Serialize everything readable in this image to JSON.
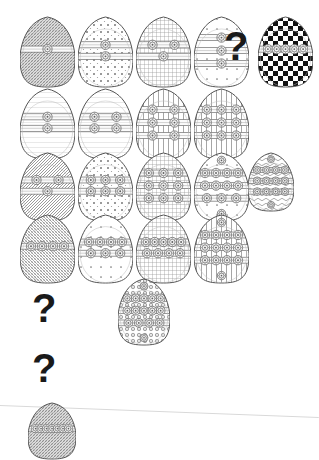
{
  "image": {
    "title": "Decorated egg pattern grid",
    "width": 319,
    "height": 460,
    "background_color": "#ffffff",
    "ink_color": "#555555",
    "question_mark_color": "#1a1a1a",
    "question_mark_glyph": "?"
  },
  "scan_artifact": {
    "name": "faint-scan-line",
    "color": "#d9d9d9",
    "x1": 0,
    "y1": 405,
    "x2": 319,
    "y2": 417
  },
  "rows": [
    {
      "row_index": 1,
      "y": 16,
      "cells": [
        {
          "kind": "egg",
          "x": 20,
          "w": 55,
          "h": 72,
          "fill": "hatch-dense",
          "bands": 1,
          "medallions": 1,
          "label": "egg-r1c1"
        },
        {
          "kind": "egg",
          "x": 78,
          "w": 55,
          "h": 72,
          "fill": "dots",
          "bands": 2,
          "medallions": 2,
          "label": "egg-r1c2"
        },
        {
          "kind": "egg",
          "x": 136,
          "w": 55,
          "h": 72,
          "fill": "grid",
          "bands": 2,
          "medallions": 3,
          "label": "egg-r1c3"
        },
        {
          "kind": "egg",
          "x": 194,
          "w": 55,
          "h": 72,
          "fill": "dots-sparse",
          "bands": 3,
          "medallions": 3,
          "label": "egg-r1c4"
        },
        {
          "kind": "question",
          "x": 224,
          "y": 26,
          "size": 40,
          "label": "question-mark-row1"
        },
        {
          "kind": "egg",
          "x": 258,
          "w": 55,
          "h": 72,
          "fill": "checker",
          "bands": 1,
          "medallions": 5,
          "label": "egg-r1-answer-checker"
        }
      ]
    },
    {
      "row_index": 2,
      "y": 88,
      "cells": [
        {
          "kind": "egg",
          "x": 20,
          "w": 55,
          "h": 72,
          "fill": "plain-lines",
          "bands": 2,
          "medallions": 2,
          "label": "egg-r2c1"
        },
        {
          "kind": "egg",
          "x": 78,
          "w": 55,
          "h": 72,
          "fill": "plain-lines",
          "bands": 2,
          "medallions": 4,
          "label": "egg-r2c2"
        },
        {
          "kind": "egg",
          "x": 136,
          "w": 55,
          "h": 72,
          "fill": "ladder",
          "bands": 3,
          "medallions": 6,
          "label": "egg-r2c3"
        },
        {
          "kind": "egg",
          "x": 194,
          "w": 55,
          "h": 72,
          "fill": "ladder",
          "bands": 3,
          "medallions": 9,
          "label": "egg-r2c4"
        }
      ]
    },
    {
      "row_index": 3,
      "y": 152,
      "cells": [
        {
          "kind": "egg",
          "x": 20,
          "w": 55,
          "h": 70,
          "fill": "hatch-top",
          "bands": 2,
          "medallions": 3,
          "label": "egg-r3c1"
        },
        {
          "kind": "egg",
          "x": 78,
          "w": 55,
          "h": 70,
          "fill": "dots",
          "bands": 2,
          "medallions": 6,
          "label": "egg-r3c2"
        },
        {
          "kind": "egg",
          "x": 136,
          "w": 55,
          "h": 70,
          "fill": "grid",
          "bands": 3,
          "medallions": 9,
          "label": "egg-r3c3"
        },
        {
          "kind": "egg",
          "x": 194,
          "w": 55,
          "h": 70,
          "fill": "dots-sparse",
          "bands": 3,
          "medallions": 11,
          "label": "egg-r3c4"
        },
        {
          "kind": "egg",
          "x": 248,
          "w": 46,
          "h": 60,
          "fill": "squiggle",
          "bands": 3,
          "medallions": 12,
          "label": "egg-r3c5"
        }
      ]
    },
    {
      "row_index": 4,
      "y": 214,
      "cells": [
        {
          "kind": "egg",
          "x": 20,
          "w": 55,
          "h": 70,
          "fill": "hatch-bottom",
          "bands": 1,
          "medallions": 4,
          "label": "egg-r4c1"
        },
        {
          "kind": "egg",
          "x": 78,
          "w": 55,
          "h": 70,
          "fill": "dots-sparse",
          "bands": 2,
          "medallions": 7,
          "label": "egg-r4c2"
        },
        {
          "kind": "egg",
          "x": 136,
          "w": 55,
          "h": 70,
          "fill": "grid",
          "bands": 2,
          "medallions": 9,
          "label": "egg-r4c3"
        },
        {
          "kind": "egg",
          "x": 194,
          "w": 55,
          "h": 70,
          "fill": "ladder",
          "bands": 3,
          "medallions": 12,
          "label": "egg-r4c4"
        }
      ]
    },
    {
      "row_index": 5,
      "y": 278,
      "cells": [
        {
          "kind": "question",
          "x": 32,
          "y": 288,
          "size": 40,
          "label": "question-mark-row5"
        },
        {
          "kind": "egg",
          "x": 118,
          "w": 52,
          "h": 68,
          "fill": "ornate",
          "bands": 3,
          "medallions": 14,
          "label": "egg-r5-ornate"
        }
      ]
    },
    {
      "row_index": 6,
      "y": 346,
      "cells": [
        {
          "kind": "question",
          "x": 32,
          "y": 348,
          "size": 40,
          "label": "question-mark-row6"
        }
      ]
    },
    {
      "row_index": 7,
      "y": 402,
      "cells": [
        {
          "kind": "egg",
          "x": 28,
          "w": 48,
          "h": 58,
          "fill": "hatch-dense",
          "bands": 1,
          "medallions": 7,
          "label": "egg-r7-final"
        }
      ]
    }
  ]
}
